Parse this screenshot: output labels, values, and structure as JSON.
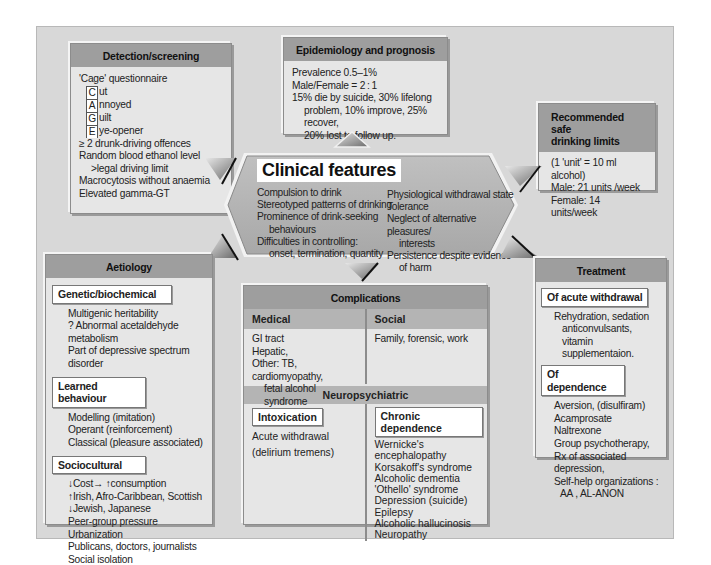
{
  "detection": {
    "title": "Detection/screening",
    "cage_title": "'Cage' questionnaire",
    "cage": [
      {
        "letter": "C",
        "rest": "ut"
      },
      {
        "letter": "A",
        "rest": "nnoyed"
      },
      {
        "letter": "G",
        "rest": "uilt"
      },
      {
        "letter": "E",
        "rest": "ye-opener"
      }
    ],
    "items": [
      "≥ 2 drunk-driving offences",
      "Random blood ethanol level",
      ">legal driving limit",
      "Macrocytosis without anaemia",
      "Elevated gamma-GT"
    ]
  },
  "epidemiology": {
    "title": "Epidemiology and prognosis",
    "items": [
      "Prevalence 0.5–1%",
      "Male/Female = 2 : 1",
      "15% die by suicide, 30% lifelong",
      "problem, 10% improve, 25% recover,",
      "20% lost to follow up."
    ]
  },
  "limits": {
    "title_line1": "Recommended safe",
    "title_line2": "drinking limits",
    "items": [
      "(1 'unit' = 10 ml alcohol)",
      "Male: 21 units /week",
      "Female: 14 units/week"
    ]
  },
  "clinical": {
    "title": "Clinical features",
    "left": [
      "Compulsion to drink",
      "Stereotyped patterns of drinking",
      "Prominence of drink-seeking",
      "behaviours",
      "Difficulties in controlling:",
      "onset, termination, quantity"
    ],
    "right": [
      "Physiological withdrawal state",
      "Tolerance",
      "Neglect of alternative pleasures/",
      "interests",
      "Persistence despite evidence",
      "of harm"
    ]
  },
  "aetiology": {
    "title": "Aetiology",
    "sections": [
      {
        "title": "Genetic/biochemical",
        "items": [
          "Multigenic heritability",
          "? Abnormal acetaldehyde metabolism",
          "Part of depressive spectrum disorder"
        ]
      },
      {
        "title": "Learned behaviour",
        "items": [
          "Modelling (imitation)",
          "Operant (reinforcement)",
          "Classical (pleasure associated)"
        ]
      },
      {
        "title": "Sociocultural",
        "items": [
          "↓Cost→ ↑consumption",
          "↑Irish, Afro-Caribbean, Scottish",
          "↓Jewish, Japanese",
          "Peer-group pressure",
          "Urbanization",
          "Publicans, doctors, journalists",
          "Social isolation"
        ]
      }
    ]
  },
  "complications": {
    "title": "Complications",
    "medical": {
      "title": "Medical",
      "items": [
        "GI tract",
        "Hepatic,",
        "Other: TB, cardiomyopathy,",
        "fetal alcohol syndrome"
      ]
    },
    "social": {
      "title": "Social",
      "items": [
        "Family, forensic, work"
      ]
    },
    "neuro_title": "Neuropsychiatric",
    "intoxication": {
      "title": "Intoxication",
      "items": [
        "Acute withdrawal",
        "(delirium tremens)"
      ]
    },
    "chronic": {
      "title": "Chronic dependence",
      "items": [
        "Wernicke's encephalopathy",
        "Korsakoff's syndrome",
        "Alcoholic dementia",
        "'Othello' syndrome",
        "Depression (suicide)",
        "Epilepsy",
        "Alcoholic hallucinosis",
        "Neuropathy"
      ]
    }
  },
  "treatment": {
    "title": "Treatment",
    "acute": {
      "title": "Of acute withdrawal",
      "items": [
        "Rehydration, sedation",
        "anticonvulsants, vitamin",
        "supplementaion."
      ]
    },
    "dependence": {
      "title": "Of dependence",
      "items": [
        "Aversion, (disulfiram)",
        "Acamprosate",
        "Naltrexone",
        "Group psychotherapy,",
        "Rx of associated depression,",
        "Self-help organizations :",
        "AA , AL-ANON"
      ]
    }
  },
  "colors": {
    "frame_bg": "#d8d8d8",
    "box_bg": "#e6e6e6",
    "header_bg": "#9e9e9e",
    "subheader_bg": "#b4b4b4",
    "hexagon_fill": "#b0b0b0"
  }
}
